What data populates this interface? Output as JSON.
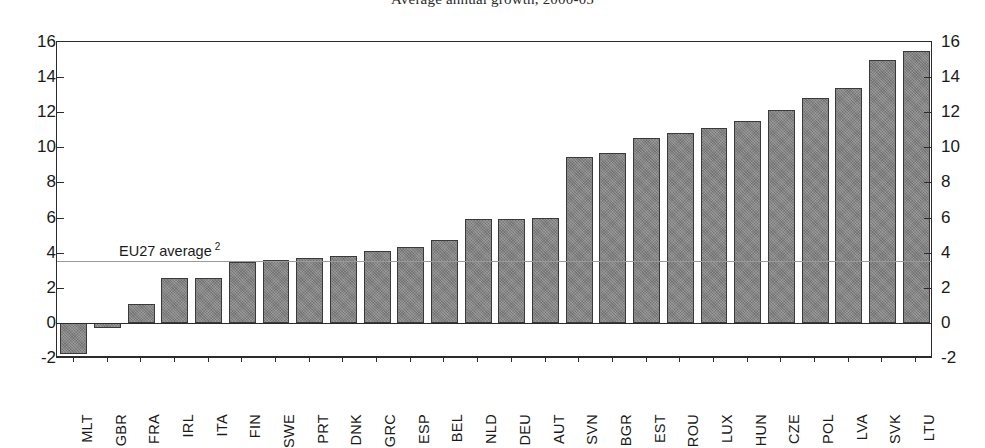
{
  "chart_data": {
    "type": "bar",
    "title": "Average annual growth, 2000-05",
    "xlabel": "",
    "ylabel": "",
    "ylim": [
      -2,
      16
    ],
    "yticks": [
      -2,
      0,
      2,
      4,
      6,
      8,
      10,
      12,
      14,
      16
    ],
    "ytick_labels": [
      "-2",
      "0",
      "2",
      "4",
      "6",
      "8",
      "10",
      "12",
      "14",
      "16"
    ],
    "grid": false,
    "legend": "none",
    "bar_color": "#838383",
    "bar_edge_color": "#3a3a3a",
    "axis_color": "#2b2b2b",
    "categories": [
      "MLT",
      "GBR",
      "FRA",
      "IRL",
      "ITA",
      "FIN",
      "SWE",
      "PRT",
      "DNK",
      "GRC",
      "ESP",
      "BEL",
      "NLD",
      "DEU",
      "AUT",
      "SVN",
      "BGR",
      "EST",
      "ROU",
      "LUX",
      "HUN",
      "CZE",
      "POL",
      "LVA",
      "SVK",
      "LTU"
    ],
    "values": [
      -1.8,
      -0.3,
      1.1,
      2.55,
      2.55,
      3.45,
      3.6,
      3.7,
      3.8,
      4.1,
      4.3,
      4.7,
      5.9,
      5.9,
      6.0,
      9.45,
      9.65,
      10.55,
      10.8,
      11.1,
      11.5,
      12.1,
      12.8,
      13.4,
      15.0,
      15.5
    ],
    "reference_line": {
      "label": "EU27 average",
      "footnote_marker": "2",
      "value": 3.5,
      "color": "#9a9a9a"
    },
    "axes": {
      "left_axis_name": "left-value-axis",
      "right_axis_name": "right-value-axis",
      "right_axis_mirrors_left": true
    }
  }
}
